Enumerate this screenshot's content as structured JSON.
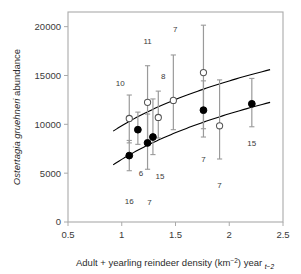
{
  "chart_data": {
    "type": "scatter",
    "title": "",
    "xlabel": "Adult + yearling reindeer density (km−2) year t−2",
    "ylabel": "Ostertagia gruehneri abundance",
    "xlabel_parts": {
      "main": "Adult + yearling reindeer density (km",
      "superscript": "−2",
      "mid": ") year ",
      "subscript": "t−2"
    },
    "ylabel_parts": {
      "italic": "Ostertagia gruehneri",
      "plain": " abundance"
    },
    "xlim": [
      0.5,
      2.5
    ],
    "ylim": [
      0,
      21500
    ],
    "xticks": [
      0.5,
      1,
      1.5,
      2,
      2.5
    ],
    "xtick_labels": [
      "0.5",
      "1",
      "1.5",
      "2",
      "2.5"
    ],
    "yticks": [
      0,
      5000,
      10000,
      15000,
      20000
    ],
    "ytick_labels": [
      "0",
      "5000",
      "10000",
      "15000",
      "20000"
    ],
    "grid": false,
    "legend_position": "none",
    "marker_colors": {
      "open": "#ffffff",
      "open_edge": "#555555",
      "filled": "#000000",
      "errorbar": "#9a9a9a",
      "curve": "#000000",
      "frame": "#aaaaaa",
      "text": "#3a3a3a"
    },
    "series": [
      {
        "name": "open-circles",
        "marker": "open-circle",
        "points": [
          {
            "x": 1.07,
            "y": 10600,
            "err_low": 8100,
            "err_high": 13000,
            "label": "10",
            "label_dx": -9,
            "label_dy": -32
          },
          {
            "x": 1.24,
            "y": 12250,
            "err_low": 8250,
            "err_high": 16000,
            "label": "11",
            "label_dx": 0,
            "label_dy": -58
          },
          {
            "x": 1.34,
            "y": 10700,
            "err_low": 8600,
            "err_high": 13400,
            "label": "8",
            "label_dx": 5,
            "label_dy": -38
          },
          {
            "x": 1.48,
            "y": 12450,
            "err_low": 9450,
            "err_high": 17100,
            "label": "7",
            "label_dx": 2,
            "label_dy": -68
          },
          {
            "x": 1.76,
            "y": 15300,
            "err_low": 9550,
            "err_high": 20150,
            "label": "4",
            "label_dx": 0,
            "label_dy": -85
          },
          {
            "x": 1.91,
            "y": 9850,
            "err_low": 6450,
            "err_high": 14550,
            "label": "7",
            "label_dx": 0,
            "label_dy": 62
          }
        ]
      },
      {
        "name": "filled-circles",
        "marker": "filled-circle",
        "points": [
          {
            "x": 1.07,
            "y": 6800,
            "err_low": 5250,
            "err_high": 8350,
            "label": "16",
            "label_dx": 0,
            "label_dy": 48
          },
          {
            "x": 1.15,
            "y": 9450,
            "err_low": 7950,
            "err_high": 11250,
            "label": "6",
            "label_dx": 3,
            "label_dy": 46
          },
          {
            "x": 1.24,
            "y": 8100,
            "err_low": 5400,
            "err_high": 11050,
            "label": "7",
            "label_dx": 2,
            "label_dy": 62
          },
          {
            "x": 1.29,
            "y": 8700,
            "err_low": 6900,
            "err_high": 12600,
            "label": "15",
            "label_dx": 7,
            "label_dy": 42
          },
          {
            "x": 1.76,
            "y": 11450,
            "err_low": 8700,
            "err_high": 14450,
            "label": "7",
            "label_dx": 0,
            "label_dy": 52
          },
          {
            "x": 2.21,
            "y": 12100,
            "err_low": 9750,
            "err_high": 14700,
            "label": "15",
            "label_dx": 0,
            "label_dy": 42
          }
        ]
      }
    ],
    "curves": [
      {
        "name": "upper-curve",
        "x_start": 0.92,
        "x_end": 2.38,
        "y_start": 9300,
        "y_end": 15600,
        "shape": "logarithmic"
      },
      {
        "name": "lower-curve",
        "x_start": 0.92,
        "x_end": 2.38,
        "y_start": 5850,
        "y_end": 12250,
        "shape": "logarithmic"
      }
    ]
  }
}
